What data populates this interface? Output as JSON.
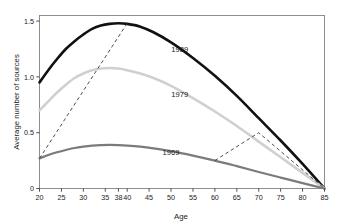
{
  "figure": {
    "top_artifact_text": "",
    "background": "#ffffff",
    "frame_color": "#8d8d8d"
  },
  "chart_data": {
    "type": "line",
    "title": "",
    "subtitle": "",
    "xlabel": "Age",
    "ylabel": "Average number of sources",
    "xlim": [
      20,
      85
    ],
    "ylim": [
      0,
      1.55
    ],
    "grid": false,
    "legend_position": "inline-labels",
    "xticks": [
      20,
      25,
      30,
      35,
      38,
      40,
      45,
      50,
      55,
      60,
      65,
      70,
      75,
      80,
      85
    ],
    "xticklabels": [
      "20",
      "25",
      "30",
      "35",
      "38",
      "40",
      "45",
      "50",
      "55",
      "60",
      "65",
      "70",
      "75",
      "80",
      "85"
    ],
    "yticks": [
      0,
      0.5,
      1.0,
      1.5
    ],
    "yticklabels": [
      "0",
      "0.5",
      "1.0",
      "1.5"
    ],
    "series": [
      {
        "name": "1989",
        "color": "#111111",
        "width": 2.6,
        "style": "solid",
        "label_x": 52,
        "label_y": 1.22,
        "x": [
          20,
          22,
          24,
          26,
          28,
          30,
          32,
          34,
          36,
          38,
          40,
          43,
          46,
          50,
          55,
          60,
          65,
          70,
          75,
          80,
          85
        ],
        "y": [
          0.95,
          1.06,
          1.16,
          1.25,
          1.32,
          1.38,
          1.43,
          1.46,
          1.475,
          1.48,
          1.475,
          1.45,
          1.4,
          1.31,
          1.17,
          1.01,
          0.83,
          0.63,
          0.43,
          0.22,
          0.0
        ]
      },
      {
        "name": "1979",
        "color": "#d0d0d0",
        "width": 2.6,
        "style": "solid",
        "label_x": 52,
        "label_y": 0.82,
        "x": [
          20,
          22,
          24,
          26,
          28,
          30,
          32,
          34,
          36,
          38,
          40,
          43,
          46,
          50,
          55,
          60,
          65,
          70,
          75,
          80,
          85
        ],
        "y": [
          0.7,
          0.78,
          0.86,
          0.93,
          0.99,
          1.03,
          1.06,
          1.075,
          1.08,
          1.075,
          1.06,
          1.03,
          0.99,
          0.92,
          0.81,
          0.69,
          0.56,
          0.42,
          0.28,
          0.14,
          0.0
        ]
      },
      {
        "name": "1969",
        "color": "#7b7b7b",
        "width": 2.2,
        "style": "solid",
        "label_x": 50,
        "label_y": 0.3,
        "x": [
          20,
          22,
          24,
          26,
          28,
          30,
          32,
          34,
          36,
          38,
          40,
          43,
          46,
          50,
          55,
          60,
          65,
          70,
          75,
          80,
          85
        ],
        "y": [
          0.27,
          0.3,
          0.325,
          0.345,
          0.363,
          0.375,
          0.384,
          0.389,
          0.391,
          0.389,
          0.385,
          0.375,
          0.36,
          0.335,
          0.295,
          0.25,
          0.2,
          0.148,
          0.098,
          0.048,
          0.0
        ]
      }
    ],
    "annotations": [
      {
        "name": "left-dashed-guide",
        "style": "dashed",
        "color": "#3a3a3a",
        "x": [
          20,
          40
        ],
        "y": [
          0.27,
          1.48
        ]
      },
      {
        "name": "right-dashed-guide",
        "style": "dashed",
        "color": "#3a3a3a",
        "x": [
          60,
          70,
          85
        ],
        "y": [
          0.25,
          0.5,
          0.0
        ]
      }
    ]
  }
}
